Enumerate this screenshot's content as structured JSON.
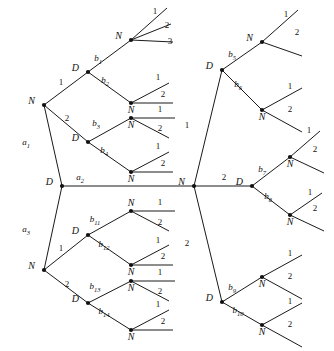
{
  "figure": {
    "type": "game-tree-diagram",
    "title": "",
    "background": "#ffffff",
    "line_color": "#1a1a1a",
    "node_color": "#111111",
    "width": 334,
    "height": 351
  },
  "labels": {
    "decision": "D",
    "nature": "N"
  },
  "root": {
    "name": "D",
    "x": 62,
    "y": 186,
    "actions": [
      {
        "label": "a",
        "sub": "1"
      },
      {
        "label": "a",
        "sub": "2"
      },
      {
        "label": "a",
        "sub": "3"
      }
    ]
  },
  "nodes": [
    {
      "id": "root",
      "type": "D",
      "x": 62,
      "y": 186,
      "label_pos": "left"
    },
    {
      "id": "n_a1",
      "type": "N",
      "x": 44,
      "y": 105,
      "label_pos": "left"
    },
    {
      "id": "n_a2",
      "type": "N",
      "x": 194,
      "y": 186,
      "label_pos": "left"
    },
    {
      "id": "n_a3",
      "type": "N",
      "x": 44,
      "y": 270,
      "label_pos": "left"
    },
    {
      "id": "d_b1",
      "type": "D",
      "x": 88,
      "y": 72,
      "label_pos": "left"
    },
    {
      "id": "d_b3",
      "type": "D",
      "x": 88,
      "y": 142,
      "label_pos": "left"
    },
    {
      "id": "d_b11",
      "type": "D",
      "x": 88,
      "y": 235,
      "label_pos": "left"
    },
    {
      "id": "d_b13",
      "type": "D",
      "x": 88,
      "y": 303,
      "label_pos": "left"
    },
    {
      "id": "d_b5",
      "type": "D",
      "x": 222,
      "y": 70,
      "label_pos": "left"
    },
    {
      "id": "d_b7",
      "type": "D",
      "x": 252,
      "y": 186,
      "label_pos": "left"
    },
    {
      "id": "d_b9",
      "type": "D",
      "x": 222,
      "y": 302,
      "label_pos": "left"
    },
    {
      "id": "t_b1",
      "type": "N",
      "x": 131,
      "y": 40,
      "label_pos": "left"
    },
    {
      "id": "t_b2",
      "type": "N",
      "x": 131,
      "y": 103,
      "label_pos": "below"
    },
    {
      "id": "t_b3",
      "type": "N",
      "x": 131,
      "y": 118,
      "label_pos": "below"
    },
    {
      "id": "t_b4",
      "type": "N",
      "x": 131,
      "y": 172,
      "label_pos": "below"
    },
    {
      "id": "t_b11",
      "type": "N",
      "x": 131,
      "y": 211,
      "label_pos": "above"
    },
    {
      "id": "t_b12",
      "type": "N",
      "x": 131,
      "y": 265,
      "label_pos": "below"
    },
    {
      "id": "t_b13",
      "type": "N",
      "x": 131,
      "y": 281,
      "label_pos": "below"
    },
    {
      "id": "t_b14",
      "type": "N",
      "x": 131,
      "y": 330,
      "label_pos": "below"
    },
    {
      "id": "t_b5",
      "type": "N",
      "x": 262,
      "y": 42,
      "label_pos": "left"
    },
    {
      "id": "t_b6",
      "type": "N",
      "x": 262,
      "y": 110,
      "label_pos": "below"
    },
    {
      "id": "t_b7",
      "type": "N",
      "x": 290,
      "y": 157,
      "label_pos": "below"
    },
    {
      "id": "t_b8",
      "type": "N",
      "x": 290,
      "y": 215,
      "label_pos": "below"
    },
    {
      "id": "t_b9",
      "type": "N",
      "x": 262,
      "y": 277,
      "label_pos": "below"
    },
    {
      "id": "t_b10",
      "type": "N",
      "x": 262,
      "y": 325,
      "label_pos": "below"
    }
  ],
  "root_edges": [
    {
      "from": "root",
      "to": "n_a1",
      "label": "a",
      "sub": "1",
      "lx": 26,
      "ly": 145
    },
    {
      "from": "root",
      "to": "n_a2",
      "label": "a",
      "sub": "2",
      "lx": 80,
      "ly": 180
    },
    {
      "from": "root",
      "to": "n_a3",
      "label": "a",
      "sub": "3",
      "lx": 26,
      "ly": 232
    }
  ],
  "chance_edges": [
    {
      "from": "n_a1",
      "to": "d_b1",
      "label": "1",
      "lx": 61,
      "ly": 85
    },
    {
      "from": "n_a1",
      "to": "d_b3",
      "label": "2",
      "lx": 67,
      "ly": 121
    },
    {
      "from": "n_a3",
      "to": "d_b11",
      "label": "1",
      "lx": 61,
      "ly": 251
    },
    {
      "from": "n_a3",
      "to": "d_b13",
      "label": "2",
      "lx": 67,
      "ly": 287
    },
    {
      "from": "n_a2",
      "to": "d_b5",
      "label": "1",
      "lx": 187,
      "ly": 128
    },
    {
      "from": "n_a2",
      "to": "d_b7",
      "label": "2",
      "lx": 224,
      "ly": 180
    },
    {
      "from": "n_a2",
      "to": "d_b9",
      "label": "2",
      "lx": 187,
      "ly": 246
    }
  ],
  "branch_edges": [
    {
      "from": "d_b1",
      "to": "t_b1",
      "label": "b",
      "sub": "1",
      "lx": 98,
      "ly": 61
    },
    {
      "from": "d_b1",
      "to": "t_b2",
      "label": "b",
      "sub": "2",
      "lx": 105,
      "ly": 83
    },
    {
      "from": "d_b3",
      "to": "t_b3",
      "label": "b",
      "sub": "3",
      "lx": 96,
      "ly": 126
    },
    {
      "from": "d_b3",
      "to": "t_b4",
      "label": "b",
      "sub": "4",
      "lx": 104,
      "ly": 153
    },
    {
      "from": "d_b11",
      "to": "t_b11",
      "label": "b",
      "sub": "11",
      "lx": 95,
      "ly": 222
    },
    {
      "from": "d_b11",
      "to": "t_b12",
      "label": "b",
      "sub": "12",
      "lx": 104,
      "ly": 247
    },
    {
      "from": "d_b13",
      "to": "t_b13",
      "label": "b",
      "sub": "13",
      "lx": 95,
      "ly": 289
    },
    {
      "from": "d_b13",
      "to": "t_b14",
      "label": "b",
      "sub": "14",
      "lx": 104,
      "ly": 314
    },
    {
      "from": "d_b5",
      "to": "t_b5",
      "label": "b",
      "sub": "5",
      "lx": 232,
      "ly": 57
    },
    {
      "from": "d_b5",
      "to": "t_b6",
      "label": "b",
      "sub": "6",
      "lx": 238,
      "ly": 87
    },
    {
      "from": "d_b7",
      "to": "t_b7",
      "label": "b",
      "sub": "7",
      "lx": 262,
      "ly": 172
    },
    {
      "from": "d_b7",
      "to": "t_b8",
      "label": "b",
      "sub": "8",
      "lx": 268,
      "ly": 199
    },
    {
      "from": "d_b9",
      "to": "t_b9",
      "label": "b",
      "sub": "9",
      "lx": 232,
      "ly": 290
    },
    {
      "from": "d_b9",
      "to": "t_b10",
      "label": "b",
      "sub": "10",
      "lx": 238,
      "ly": 313
    }
  ],
  "terminal_edges": [
    {
      "from": "t_b1",
      "dx": 36,
      "dy": -32,
      "label": "1",
      "lx": 155,
      "ly": 14
    },
    {
      "from": "t_b1",
      "dx": 40,
      "dy": -16,
      "label": "2",
      "lx": 167,
      "ly": 28
    },
    {
      "from": "t_b1",
      "dx": 42,
      "dy": 2,
      "label": "3",
      "lx": 170,
      "ly": 44
    },
    {
      "from": "t_b2",
      "dx": 38,
      "dy": -20,
      "label": "1",
      "lx": 158,
      "ly": 80
    },
    {
      "from": "t_b2",
      "dx": 42,
      "dy": 0,
      "label": "2",
      "lx": 163,
      "ly": 97
    },
    {
      "from": "t_b3",
      "dx": 44,
      "dy": 0,
      "label": "1",
      "lx": 160,
      "ly": 112
    },
    {
      "from": "t_b3",
      "dx": 38,
      "dy": 20,
      "label": "2",
      "lx": 160,
      "ly": 131
    },
    {
      "from": "t_b4",
      "dx": 38,
      "dy": -20,
      "label": "1",
      "lx": 158,
      "ly": 149
    },
    {
      "from": "t_b4",
      "dx": 42,
      "dy": 0,
      "label": "2",
      "lx": 163,
      "ly": 166
    },
    {
      "from": "t_b11",
      "dx": 44,
      "dy": 0,
      "label": "1",
      "lx": 160,
      "ly": 205
    },
    {
      "from": "t_b11",
      "dx": 38,
      "dy": 20,
      "label": "2",
      "lx": 160,
      "ly": 225
    },
    {
      "from": "t_b12",
      "dx": 38,
      "dy": -20,
      "label": "1",
      "lx": 158,
      "ly": 243
    },
    {
      "from": "t_b12",
      "dx": 42,
      "dy": 0,
      "label": "2",
      "lx": 163,
      "ly": 259
    },
    {
      "from": "t_b13",
      "dx": 44,
      "dy": 0,
      "label": "1",
      "lx": 160,
      "ly": 275
    },
    {
      "from": "t_b13",
      "dx": 38,
      "dy": 20,
      "label": "2",
      "lx": 160,
      "ly": 294
    },
    {
      "from": "t_b14",
      "dx": 38,
      "dy": -20,
      "label": "1",
      "lx": 158,
      "ly": 307
    },
    {
      "from": "t_b14",
      "dx": 42,
      "dy": 0,
      "label": "2",
      "lx": 163,
      "ly": 324
    },
    {
      "from": "t_b5",
      "dx": 36,
      "dy": -32,
      "label": "1",
      "lx": 286,
      "ly": 17
    },
    {
      "from": "t_b5",
      "dx": 40,
      "dy": 14,
      "label": "2",
      "lx": 297,
      "ly": 35
    },
    {
      "from": "t_b6",
      "dx": 40,
      "dy": -22,
      "label": "1",
      "lx": 290,
      "ly": 89
    },
    {
      "from": "t_b6",
      "dx": 40,
      "dy": 22,
      "label": "2",
      "lx": 290,
      "ly": 112
    },
    {
      "from": "t_b7",
      "dx": 30,
      "dy": -26,
      "label": "1",
      "lx": 309,
      "ly": 133
    },
    {
      "from": "t_b7",
      "dx": 34,
      "dy": 16,
      "label": "2",
      "lx": 315,
      "ly": 152
    },
    {
      "from": "t_b8",
      "dx": 32,
      "dy": -22,
      "label": "1",
      "lx": 310,
      "ly": 195
    },
    {
      "from": "t_b8",
      "dx": 34,
      "dy": 16,
      "label": "2",
      "lx": 315,
      "ly": 211
    },
    {
      "from": "t_b9",
      "dx": 40,
      "dy": -22,
      "label": "1",
      "lx": 290,
      "ly": 256
    },
    {
      "from": "t_b9",
      "dx": 40,
      "dy": 22,
      "label": "2",
      "lx": 290,
      "ly": 279
    },
    {
      "from": "t_b10",
      "dx": 40,
      "dy": -22,
      "label": "1",
      "lx": 290,
      "ly": 304
    },
    {
      "from": "t_b10",
      "dx": 40,
      "dy": 22,
      "label": "2",
      "lx": 290,
      "ly": 327
    }
  ]
}
